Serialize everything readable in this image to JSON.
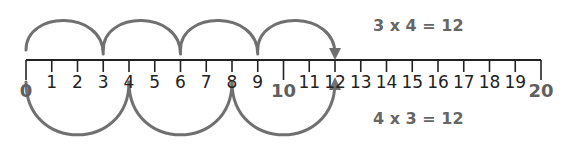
{
  "number_line": {
    "min": 0,
    "max": 20,
    "step": 1,
    "labels": [
      "0",
      "1",
      "2",
      "3",
      "4",
      "5",
      "6",
      "7",
      "8",
      "9",
      "10",
      "11",
      "12",
      "13",
      "14",
      "15",
      "16",
      "17",
      "18",
      "19",
      "20"
    ],
    "major_labels": [
      "0",
      "10",
      "20"
    ]
  },
  "top_jumps": {
    "size": 3,
    "count": 4,
    "stops": [
      0,
      3,
      6,
      9,
      12
    ],
    "equation": "3 x 4 = 12",
    "arrow_target": 12
  },
  "bottom_jumps": {
    "size": 4,
    "count": 3,
    "stops": [
      0,
      4,
      8,
      12
    ],
    "equation": "4 x 3 = 12",
    "arrow_target": 12
  },
  "colors": {
    "line": "#222222",
    "arc": "#707070",
    "equation_text": "#666666",
    "number_text": "#222222",
    "major_number_text": "#5f5f5f"
  }
}
